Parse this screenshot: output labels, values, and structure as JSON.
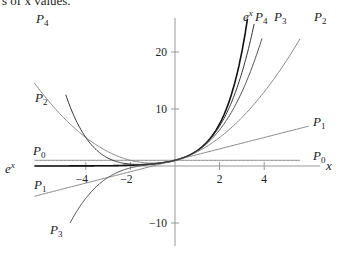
{
  "caption": "s of x values.",
  "chart_data": {
    "type": "line",
    "xlabel": "x",
    "ylabel": "",
    "xlim": [
      -6.3,
      6.5
    ],
    "ylim": [
      -14,
      26
    ],
    "grid": false,
    "x_ticks": [
      -4,
      -2,
      2,
      4
    ],
    "y_ticks": [
      -10,
      10,
      20
    ],
    "series": [
      {
        "name": "e^x",
        "label_main": "e",
        "label_sup": "x",
        "formula": "exp(x)",
        "color": "#111111",
        "width": 1.6
      },
      {
        "name": "P0",
        "label_main": "P",
        "label_sub": "0",
        "formula": "1",
        "color": "#888888",
        "width": 1.0
      },
      {
        "name": "P1",
        "label_main": "P",
        "label_sub": "1",
        "formula": "1 + x",
        "color": "#888888",
        "width": 1.0
      },
      {
        "name": "P2",
        "label_main": "P",
        "label_sub": "2",
        "formula": "1 + x + x^2/2",
        "color": "#888888",
        "width": 1.0
      },
      {
        "name": "P3",
        "label_main": "P",
        "label_sub": "3",
        "formula": "1 + x + x^2/2 + x^3/6",
        "color": "#555555",
        "width": 1.0
      },
      {
        "name": "P4",
        "label_main": "P",
        "label_sub": "4",
        "formula": "1 + x + x^2/2 + x^3/6 + x^4/24",
        "color": "#333333",
        "width": 1.0
      }
    ],
    "sample_points": {
      "x": [
        -6,
        -4,
        -2,
        0,
        2,
        4,
        6
      ],
      "e^x": [
        0.0025,
        0.018,
        0.135,
        1,
        7.39,
        54.6,
        403.4
      ],
      "P0": [
        1,
        1,
        1,
        1,
        1,
        1,
        1
      ],
      "P1": [
        -5,
        -3,
        -1,
        1,
        3,
        5,
        7
      ],
      "P2": [
        13,
        5,
        1,
        1,
        5,
        13,
        25
      ],
      "P3": [
        -23,
        -5.67,
        -0.33,
        1,
        6.33,
        23.67,
        61
      ],
      "P4": [
        31,
        5,
        0.33,
        1,
        7,
        34.33,
        115
      ]
    }
  }
}
